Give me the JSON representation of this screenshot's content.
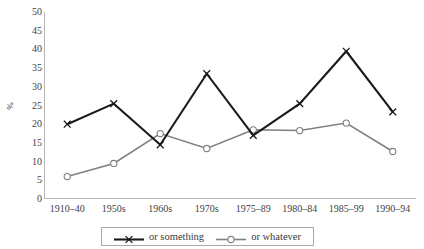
{
  "chart_data": {
    "type": "line",
    "title": "",
    "xlabel": "",
    "ylabel": "%",
    "ylim": [
      0,
      50
    ],
    "ytick_step": 5,
    "yticks": [
      50,
      45,
      40,
      35,
      30,
      25,
      20,
      15,
      10,
      5,
      0
    ],
    "grid": false,
    "legend_position": "bottom",
    "categories": [
      "1910–40",
      "1950s",
      "1960s",
      "1970s",
      "1975–89",
      "1980–84",
      "1985–99",
      "1990–94"
    ],
    "series": [
      {
        "name": "or something",
        "color": "#1a1a1a",
        "marker": "x",
        "values": [
          20,
          25.5,
          14.5,
          33.5,
          17,
          25.5,
          39.5,
          23.3
        ]
      },
      {
        "name": "or whatever",
        "color": "#808080",
        "marker": "circle",
        "values": [
          6,
          9.5,
          17.5,
          13.5,
          18.5,
          18.3,
          20.3,
          12.7
        ]
      }
    ]
  },
  "legend": {
    "items": [
      {
        "label": "or something"
      },
      {
        "label": "or whatever"
      }
    ]
  },
  "axis": {
    "y_title": "%"
  }
}
